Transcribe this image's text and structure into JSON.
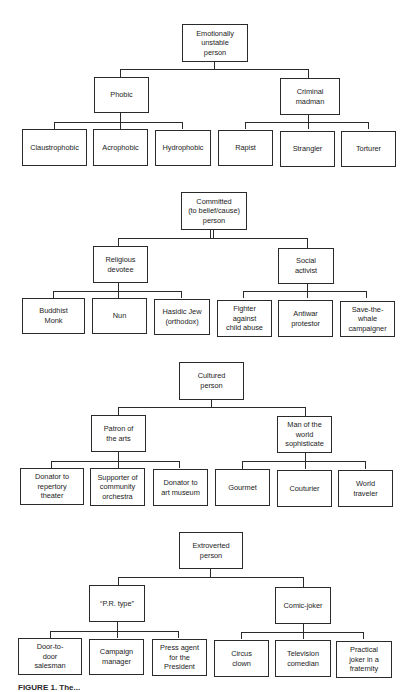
{
  "figure": {
    "caption_partial": "FIGURE 1. The..."
  },
  "trees": [
    {
      "root": "Emotionally\nunstable\nperson",
      "branches": [
        {
          "label": "Phobic",
          "leaves": [
            "Claustrophobic",
            "Acrophobic",
            "Hydrophobic"
          ]
        },
        {
          "label": "Criminal\nmadman",
          "leaves": [
            "Rapist",
            "Strangler",
            "Torturer"
          ]
        }
      ]
    },
    {
      "root": "Committed\n(to belief/cause)\nperson",
      "branches": [
        {
          "label": "Religious\ndevotee",
          "leaves": [
            "Buddhist\nMonk",
            "Nun",
            "Hasidic Jew\n(orthodox)"
          ]
        },
        {
          "label": "Social\nactivist",
          "leaves": [
            "Fighter\nagainst\nchild abuse",
            "Antiwar\nprotestor",
            "Save-the-\nwhale\ncampaigner"
          ]
        }
      ]
    },
    {
      "root": "Cultured\nperson",
      "branches": [
        {
          "label": "Patron of\nthe arts",
          "leaves": [
            "Donator to\nrepertory\ntheater",
            "Supporter of\ncommunity\norchestra",
            "Donator to\nart museum"
          ]
        },
        {
          "label": "Man of the\nworld\nsophisticate",
          "leaves": [
            "Gourmet",
            "Couturier",
            "World\ntraveler"
          ]
        }
      ]
    },
    {
      "root": "Extroverted\nperson",
      "branches": [
        {
          "label": "“P.R. type”",
          "leaves": [
            "Door-to-\ndoor\nsalesman",
            "Campaign\nmanager",
            "Press agent\nfor the\nPresident"
          ]
        },
        {
          "label": "Comic-joker",
          "leaves": [
            "Circus\nclown",
            "Television\ncomedian",
            "Practical\njoker in a\nfraternity"
          ]
        }
      ]
    }
  ]
}
